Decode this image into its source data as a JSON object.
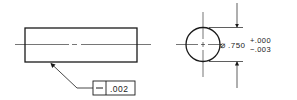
{
  "drawing": {
    "side_view": {
      "label": "cylinder side view",
      "feature_control_frame": {
        "symbol": "straightness",
        "tolerance": ".002"
      }
    },
    "end_view": {
      "label": "cylinder end view",
      "diameter_symbol": "⌀",
      "diameter_value": ".750",
      "upper_tolerance": "+.000",
      "lower_tolerance": "−.003"
    },
    "colors": {
      "line": "#1a1a1a",
      "background": "#ffffff"
    }
  }
}
